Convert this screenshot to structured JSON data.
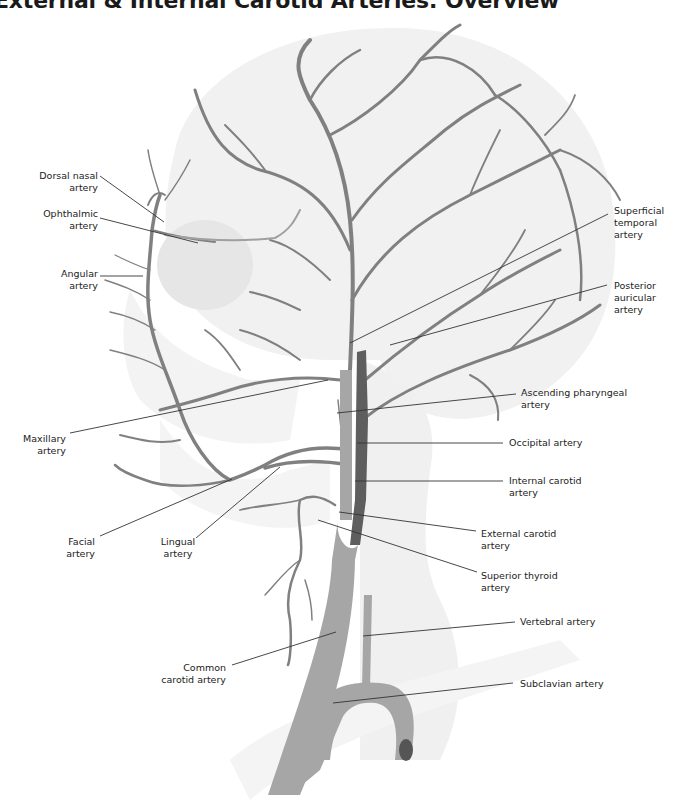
{
  "title": "External & Internal Carotid Arteries: Overview",
  "colors": {
    "external_artery": "#808080",
    "internal_carotid": "#5e5e5e",
    "common_carotid": "#a6a6a6",
    "skull_shading": "#ececec",
    "leader_line": "#333333",
    "label_text": "#222222"
  },
  "labels": {
    "dorsal_nasal": [
      "Dorsal nasal",
      "artery"
    ],
    "ophthalmic": [
      "Ophthalmic",
      "artery"
    ],
    "angular": [
      "Angular",
      "artery"
    ],
    "maxillary": [
      "Maxillary",
      "artery"
    ],
    "facial": [
      "Facial",
      "artery"
    ],
    "lingual": [
      "Lingual",
      "artery"
    ],
    "common_carotid": [
      "Common",
      "carotid artery"
    ],
    "superficial_temporal": [
      "Superficial",
      "temporal",
      "artery"
    ],
    "posterior_auricular": [
      "Posterior",
      "auricular",
      "artery"
    ],
    "ascending_pharyngeal": [
      "Ascending pharyngeal",
      "artery"
    ],
    "occipital": [
      "Occipital artery"
    ],
    "internal_carotid": [
      "Internal carotid",
      "artery"
    ],
    "external_carotid": [
      "External carotid",
      "artery"
    ],
    "superior_thyroid": [
      "Superior thyroid",
      "artery"
    ],
    "vertebral": [
      "Vertebral artery"
    ],
    "subclavian": [
      "Subclavian artery"
    ]
  }
}
